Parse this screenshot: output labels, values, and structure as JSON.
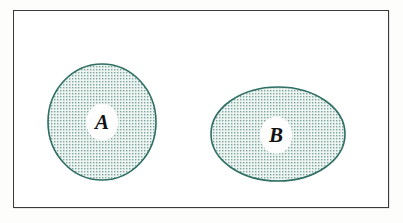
{
  "figure": {
    "kind": "venn-diagram",
    "caption": "",
    "background_color": "#ffffff"
  },
  "universe": {
    "name": "universal-set-rectangle",
    "label": "",
    "border_color": "#3a3a3a",
    "fill_color": "#ffffff",
    "x": 13,
    "y": 10,
    "width": 376,
    "height": 198
  },
  "style": {
    "set_outline_color": "#2e6e63",
    "set_hatch_color": "#6f9d95",
    "set_fill_color": "#eef4f2",
    "label_color": "#121212"
  },
  "sets": [
    {
      "id": "set-a",
      "label": "A",
      "shape": "circle",
      "cx": 102,
      "cy": 122,
      "rx": 54,
      "ry": 58,
      "label_x": 102,
      "label_y": 122,
      "label_size": 21
    },
    {
      "id": "set-b",
      "label": "B",
      "shape": "ellipse",
      "cx": 278,
      "cy": 134,
      "rx": 67,
      "ry": 47,
      "label_x": 276,
      "label_y": 135,
      "label_size": 21
    }
  ],
  "chart_data": {
    "type": "table",
    "xlabel": "",
    "ylabel": "",
    "categories": [
      "A",
      "B"
    ],
    "values": [
      1,
      1
    ],
    "annotations": [
      "A and B do not overlap (disjoint sets)",
      "Both sets are drawn inside a rectangular universal set"
    ],
    "legend": []
  }
}
